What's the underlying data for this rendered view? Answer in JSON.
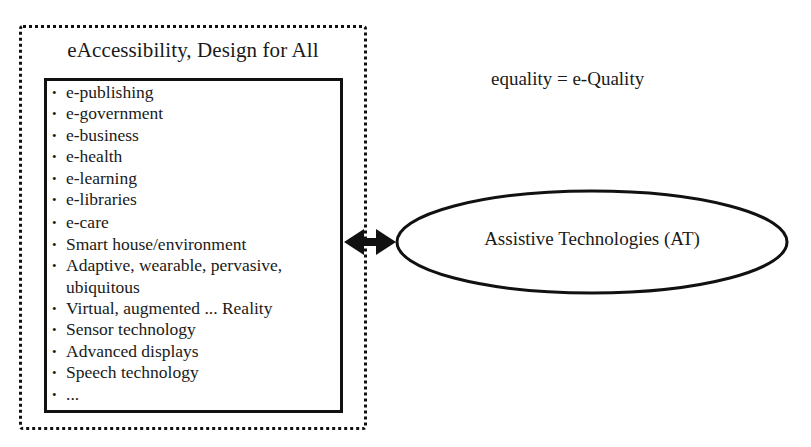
{
  "diagram": {
    "outer_box": {
      "title": "eAccessibility, Design for All",
      "style": "dotted"
    },
    "inner_list": {
      "items": [
        "e-publishing",
        "e-government",
        "e-business",
        "e-health",
        "e-learning",
        "e-libraries",
        "e-care",
        "Smart house/environment",
        "Adaptive, wearable, pervasive,",
        "ubiquitous",
        "Virtual, augmented ... Reality",
        "Sensor technology",
        "Advanced displays",
        "Speech technology",
        "..."
      ],
      "bullet": "•"
    },
    "equation": "equality = e-Quality",
    "ellipse": {
      "label": "Assistive Technologies (AT)"
    },
    "connector": {
      "type": "double-headed-arrow",
      "from": "eAccessibility, Design for All",
      "to": "Assistive Technologies (AT)"
    },
    "colors": {
      "stroke": "#111111",
      "text": "#1a1a1a",
      "background": "#ffffff"
    }
  }
}
